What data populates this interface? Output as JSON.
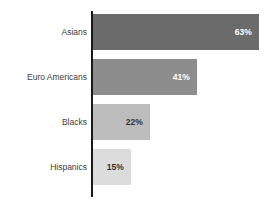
{
  "chart_data": {
    "type": "bar",
    "orientation": "horizontal",
    "title": "",
    "subtitle": "",
    "xlabel": "",
    "ylabel": "",
    "categories": [
      "Asians",
      "Euro Americans",
      "Blacks",
      "Hispanics"
    ],
    "values": [
      63,
      41,
      22,
      15
    ],
    "value_labels": [
      "63%",
      "41%",
      "22%",
      "15%"
    ],
    "xlim": [
      0,
      70
    ],
    "grid": false,
    "legend": false,
    "legend_position": "none",
    "series": [
      {
        "name": "",
        "values": [
          63,
          41,
          22,
          15
        ]
      }
    ],
    "bar_colors": [
      "#6b6b6b",
      "#8d8d8d",
      "#bcbcbc",
      "#dcdcdc"
    ],
    "label_colors": [
      "#ffffff",
      "#ffffff",
      "#333333",
      "#333333"
    ],
    "axis_line_color": "#1a1a1a",
    "background_color": "#ffffff",
    "category_label_color": "#3d3d3d"
  },
  "bars": [
    {
      "category": "Asians",
      "value": 63,
      "value_label": "63%",
      "width_px": 166,
      "color": "#6b6b6b",
      "label_color": "#ffffff"
    },
    {
      "category": "Euro Americans",
      "value": 41,
      "value_label": "41%",
      "width_px": 104,
      "color": "#8d8d8d",
      "label_color": "#ffffff"
    },
    {
      "category": "Blacks",
      "value": 22,
      "value_label": "22%",
      "width_px": 57,
      "color": "#bcbcbc",
      "label_color": "#333333"
    },
    {
      "category": "Hispanics",
      "value": 15,
      "value_label": "15%",
      "width_px": 38,
      "color": "#dcdcdc",
      "label_color": "#333333"
    }
  ]
}
